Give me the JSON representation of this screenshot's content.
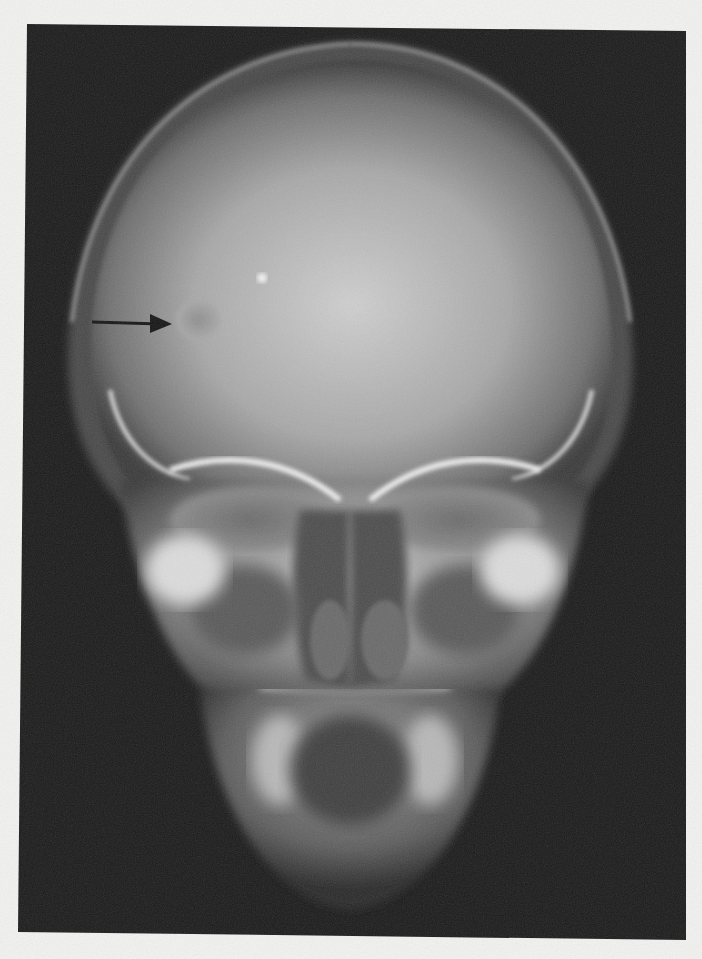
{
  "image": {
    "type": "radiograph",
    "view": "frontal (PA) skull",
    "background_color": "#f2f2f0",
    "film_color": "#1c1c1c",
    "bone_color": "#d9d9d9"
  },
  "annotations": [
    {
      "kind": "arrow",
      "direction": "right",
      "color": "#111111",
      "points_to": "lucent-lesion-right-frontal"
    }
  ],
  "findings": [
    {
      "name": "lucent-lesion-right-frontal"
    }
  ]
}
